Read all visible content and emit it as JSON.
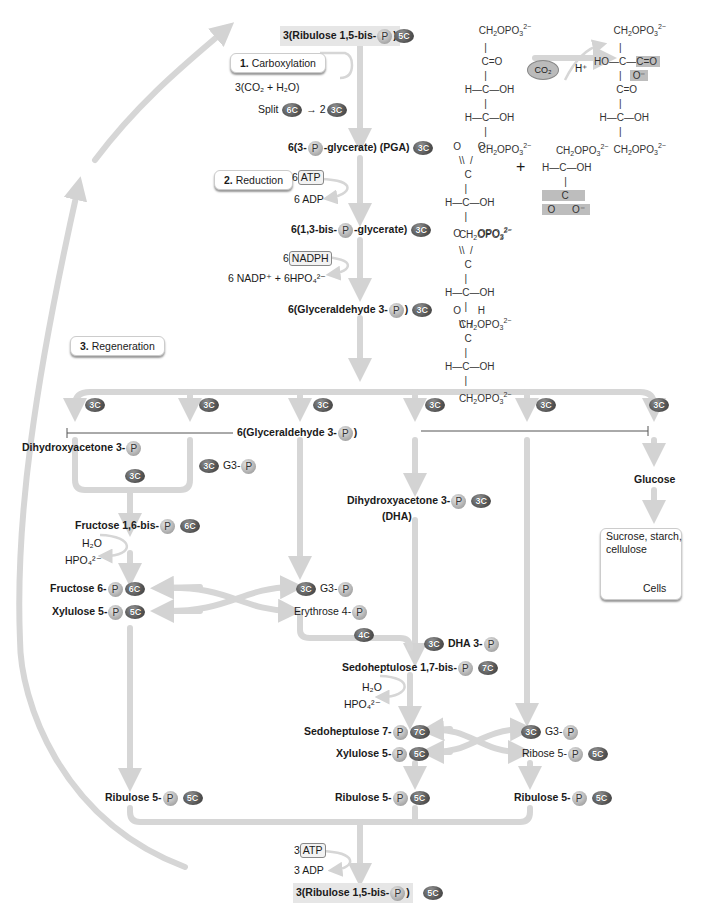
{
  "stages": {
    "carboxylation": {
      "num": "1.",
      "label": "Carboxylation"
    },
    "reduction": {
      "num": "2.",
      "label": "Reduction"
    },
    "regeneration": {
      "num": "3.",
      "label": "Regeneration"
    }
  },
  "top": {
    "rubp_prefix": "3(Ribulose 1,5-bis-",
    "rubp_suffix": ")",
    "rubp_carbon": "5C",
    "co2_in": "3(CO₂ + H₂O)",
    "split_label": "Split",
    "split_from": "6C",
    "split_arrow": "→ 2",
    "split_to": "3C",
    "pga_prefix": "6(3-",
    "pga_suffix": "-glycerate) (PGA)",
    "pga_carbon": "3C",
    "atp_coef": "6",
    "atp": "ATP",
    "adp": "6 ADP",
    "bpg_prefix": "6(1,3-bis-",
    "bpg_suffix": "-glycerate)",
    "bpg_carbon": "3C",
    "nadph_coef": "6",
    "nadph": "NADPH",
    "nadp_out": "6 NADP⁺ + 6HPO₄²⁻",
    "g3p_prefix": "6(Glyceraldehyde 3-",
    "g3p_suffix": ")",
    "g3p_carbon": "3C",
    "phosphate": "P"
  },
  "structures": {
    "rubp": [
      "CH₂OPO₃²⁻",
      "C=O",
      "H—C—OH",
      "H—C—OH",
      "CH₂OPO₃²⁻"
    ],
    "co2_badge": "CO₂",
    "h_plus": "H⁺",
    "intermediate": [
      "CH₂OPO₃²⁻",
      "HO—C—C=O / O⁻",
      "C=O",
      "H—C—OH",
      "CH₂OPO₃²⁻"
    ],
    "pga": [
      "O  O⁻",
      "C",
      "H—C—OH",
      "CH₂OPO₃²⁻"
    ],
    "plus": "+",
    "pga2": [
      "CH₂OPO₃²⁻",
      "H—C—OH",
      "C",
      "O  O⁻"
    ],
    "bpg": [
      "O  OPO₃²⁻",
      "C",
      "H—C—OH",
      "CH₂OPO₃²⁻"
    ],
    "g3p": [
      "O  H",
      "C",
      "H—C—OH",
      "CH₂OPO₃²⁻"
    ]
  },
  "regeneration": {
    "branch_carbon": "3C",
    "bar_label_prefix": "6(Glyceraldehyde 3-",
    "bar_label_suffix": ")",
    "dhap": "Dihydroxyacetone 3-",
    "g3": "G3-",
    "fbp": "Fructose 1,6-bis-",
    "c6": "6C",
    "h2o": "H₂O",
    "hpo4": "HPO₄²⁻",
    "f6p": "Fructose 6-",
    "xu5p": "Xylulose 5-",
    "c5": "5C",
    "e4p": "Erythrose 4-",
    "c4": "4C",
    "dha_mid": "Dihydroxyacetone 3-",
    "dha_abbr": "(DHA)",
    "dha3": "DHA 3-",
    "sbp": "Sedoheptulose 1,7-bis-",
    "c7": "7C",
    "s7p": "Sedoheptulose 7-",
    "r5p": "Ribose 5-",
    "ru5p": "Ribulose 5-",
    "glucose": "Glucose",
    "sucrose": "Sucrose, starch,\ncellulose",
    "cells": "Cells",
    "atp_coef": "3",
    "atp": "ATP",
    "adp": "3 ADP",
    "rubp_prefix": "3(Ribulose 1,5-bis-",
    "rubp_suffix": ")",
    "c3": "3C"
  }
}
